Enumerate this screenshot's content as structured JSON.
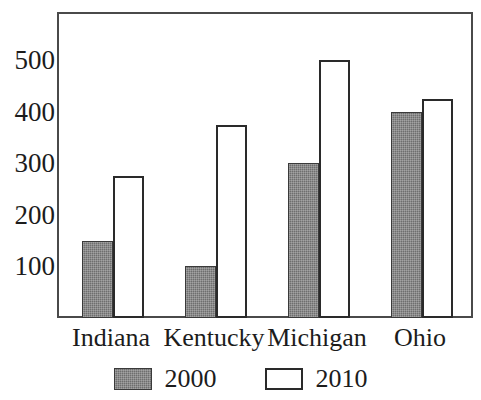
{
  "chart_data": {
    "type": "bar",
    "title": "",
    "subtitle": "",
    "xlabel": "",
    "ylabel": "",
    "categories": [
      "Indiana",
      "Kentucky",
      "Michigan",
      "Ohio"
    ],
    "series": [
      {
        "name": "2000",
        "color": "#6e6e6e",
        "values": [
          150,
          100,
          300,
          400
        ]
      },
      {
        "name": "2010",
        "color": "#ffffff",
        "values": [
          275,
          375,
          500,
          425
        ]
      }
    ],
    "ylim": [
      0,
      590
    ],
    "yticks": [
      100,
      200,
      300,
      400,
      500
    ],
    "ytick_labels": [
      "100",
      "200",
      "300",
      "400",
      "500"
    ],
    "grid": false,
    "legend_position": "bottom",
    "legend_entries": [
      "2000",
      "2010"
    ],
    "frame": true,
    "colors": {
      "series_2000_fill": "#6e6e6e",
      "series_2000_border": "#3a3a3a",
      "series_2010_fill": "#ffffff",
      "series_2010_border": "#2a2a2a",
      "frame_border": "#4a4a4a",
      "text": "#1c1c1c",
      "background": "#ffffff"
    }
  }
}
